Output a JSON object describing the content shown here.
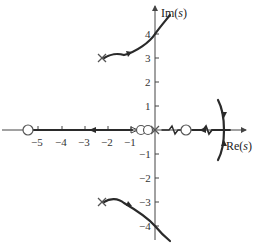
{
  "diagram": {
    "type": "root-locus",
    "axes": {
      "x_label_prefix": "Re(",
      "x_label_var": "s",
      "x_label_suffix": ")",
      "y_label_prefix": "Im(",
      "y_label_var": "s",
      "y_label_suffix": ")",
      "x_ticks": [
        "−5",
        "−4",
        "−3",
        "−2",
        "−1"
      ],
      "y_ticks_pos": [
        "4",
        "3",
        "2",
        "1"
      ],
      "y_ticks_neg": [
        "−1",
        "−2",
        "−3",
        "−4"
      ]
    },
    "poles": [
      {
        "re": -2.3,
        "im": 3
      },
      {
        "re": -2.3,
        "im": -3
      },
      {
        "re": 0,
        "im": 0
      }
    ],
    "zeros": [
      {
        "re": -5.2,
        "im": 0
      },
      {
        "re": -0.7,
        "im": 0
      },
      {
        "re": -0.3,
        "im": 0
      },
      {
        "re": 1.3,
        "im": 0
      }
    ],
    "colors": {
      "locus": "#2a2a2a",
      "axis": "#444444",
      "background": "#ffffff"
    }
  }
}
